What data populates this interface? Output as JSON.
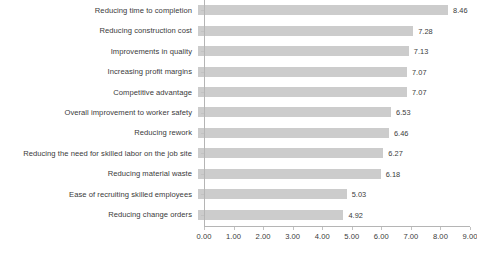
{
  "chart_data": {
    "type": "bar",
    "orientation": "horizontal",
    "title": "",
    "subtitle": "",
    "xlabel": "",
    "ylabel": "",
    "xlim": [
      0,
      9
    ],
    "xticks": [
      0,
      1,
      2,
      3,
      4,
      5,
      6,
      7,
      8,
      9
    ],
    "xtick_labels": [
      "0.00",
      "1.00",
      "2.00",
      "3.00",
      "4.00",
      "5.00",
      "6.00",
      "7.00",
      "8.00",
      "9.00"
    ],
    "grid": false,
    "legend": null,
    "bar_color": "#cccccc",
    "axis_color": "#b5b5b5",
    "text_color": "#3a3a3a",
    "categories": [
      "Reducing time to completion",
      "Reducing construction cost",
      "Improvements in quality",
      "Increasing profit margins",
      "Competitive advantage",
      "Overall improvement to worker safety",
      "Reducing rework",
      "Reducing the need for skilled labor on the job site",
      "Reducing material waste",
      "Ease of recruiting skilled employees",
      "Reducing change orders"
    ],
    "values": [
      8.46,
      7.28,
      7.13,
      7.07,
      7.07,
      6.53,
      6.46,
      6.27,
      6.18,
      5.03,
      4.92
    ],
    "value_labels": [
      "8.46",
      "7.28",
      "7.13",
      "7.07",
      "7.07",
      "6.53",
      "6.46",
      "6.27",
      "6.18",
      "5.03",
      "4.92"
    ]
  }
}
